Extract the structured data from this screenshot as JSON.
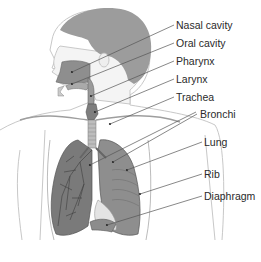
{
  "diagram": {
    "labels": [
      {
        "text": "Nasal cavity",
        "x": 176,
        "y": 20
      },
      {
        "text": "Oral cavity",
        "x": 176,
        "y": 38
      },
      {
        "text": "Pharynx",
        "x": 176,
        "y": 56
      },
      {
        "text": "Larynx",
        "x": 176,
        "y": 74
      },
      {
        "text": "Trachea",
        "x": 176,
        "y": 92
      },
      {
        "text": "Bronchi",
        "x": 200,
        "y": 109
      },
      {
        "text": "Lung",
        "x": 204,
        "y": 137
      },
      {
        "text": "Rib",
        "x": 204,
        "y": 169
      },
      {
        "text": "Diaphragm",
        "x": 204,
        "y": 191
      }
    ],
    "colors": {
      "hair": "#9a9a9a",
      "skin_outline": "#b8b8b8",
      "organ_fill": "#8e8e8e",
      "organ_dark": "#6e6e6e",
      "leader_line": "#555555",
      "label_text": "#2a2a2a"
    }
  }
}
